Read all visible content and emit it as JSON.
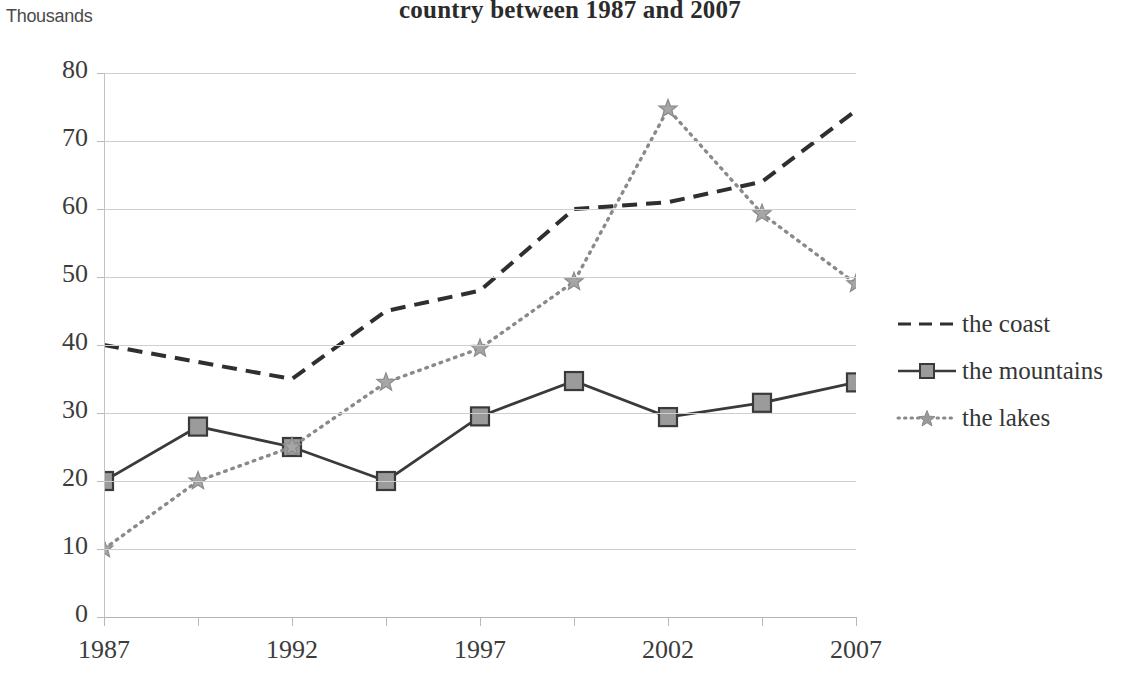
{
  "chart_data": {
    "type": "line",
    "title": "country between 1987 and 2007",
    "unit_label": "Thousands",
    "xlabel": "",
    "ylabel": "",
    "ylim": [
      0,
      80
    ],
    "y_ticks": [
      0,
      10,
      20,
      30,
      40,
      50,
      60,
      70,
      80
    ],
    "grid": true,
    "legend_position": "right",
    "x": [
      1987,
      1989.5,
      1992,
      1994.5,
      1997,
      1999.5,
      2002,
      2004.5,
      2007
    ],
    "x_tick_labels": [
      "1987",
      "1992",
      "1997",
      "2002",
      "2007"
    ],
    "x_tick_values": [
      1987,
      1992,
      1997,
      2002,
      2007
    ],
    "xlim": [
      1987,
      2007
    ],
    "series": [
      {
        "name": "the coast",
        "style": "dashed",
        "marker": "none",
        "color": "#2f2f2f",
        "values": [
          40,
          37.5,
          35,
          45,
          48,
          60,
          61,
          64,
          74.5
        ]
      },
      {
        "name": "the mountains",
        "style": "solid",
        "marker": "square",
        "color": "#3a3a3a",
        "marker_fill": "#9b9b9b",
        "values": [
          20,
          28,
          25,
          20,
          29.5,
          34.7,
          29.4,
          31.5,
          34.5
        ]
      },
      {
        "name": "the lakes",
        "style": "dotted",
        "marker": "star",
        "color": "#8a8a8a",
        "values": [
          10,
          20,
          25,
          34.5,
          39.5,
          49.3,
          74.7,
          59.3,
          49
        ]
      }
    ]
  },
  "legend": {
    "items": [
      {
        "label": "the coast"
      },
      {
        "label": "the mountains"
      },
      {
        "label": "the lakes"
      }
    ]
  },
  "axis": {
    "unit": "Thousands",
    "y_labels": [
      "80",
      "70",
      "60",
      "50",
      "40",
      "30",
      "20",
      "10",
      "0"
    ],
    "x_labels": [
      "1987",
      "1992",
      "1997",
      "2002",
      "2007"
    ]
  }
}
